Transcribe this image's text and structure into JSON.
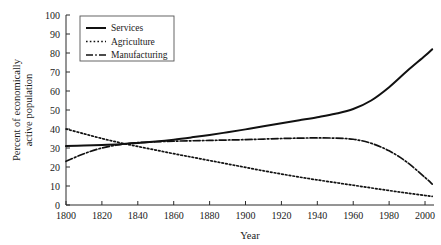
{
  "chart_data": {
    "type": "line",
    "title": "",
    "xlabel": "Year",
    "ylabel": "Percent of economically\nactive population",
    "ylabel_line1": "Percent of economically",
    "ylabel_line2": "active population",
    "xlim": [
      1800,
      2005
    ],
    "ylim": [
      0,
      100
    ],
    "xticks": [
      1800,
      1820,
      1840,
      1860,
      1880,
      1900,
      1920,
      1940,
      1960,
      1980,
      2000
    ],
    "xticklabels": [
      "1800",
      "1820",
      "1840",
      "1860",
      "1880",
      "1900",
      "1920",
      "1940",
      "1960",
      "1980",
      "2000"
    ],
    "yticks": [
      0,
      10,
      20,
      30,
      40,
      50,
      60,
      70,
      80,
      90,
      100
    ],
    "yticklabels": [
      "0",
      "10",
      "20",
      "30",
      "40",
      "50",
      "60",
      "70",
      "80",
      "90",
      "100"
    ],
    "grid": false,
    "legend_position": "upper-left",
    "series": [
      {
        "name": "Services",
        "style": "solid",
        "color": "#111111",
        "x": [
          1800,
          1810,
          1820,
          1830,
          1840,
          1850,
          1860,
          1870,
          1880,
          1890,
          1900,
          1910,
          1920,
          1930,
          1940,
          1950,
          1960,
          1970,
          1980,
          1990,
          2000,
          2004
        ],
        "values": [
          31,
          31.3,
          31.6,
          32,
          32.6,
          33.4,
          34.4,
          35.6,
          36.9,
          38.3,
          39.8,
          41.4,
          43.0,
          44.6,
          46.2,
          48.0,
          50.5,
          55.0,
          62.0,
          70.5,
          78.5,
          82
        ]
      },
      {
        "name": "Agriculture",
        "style": "dotted",
        "color": "#111111",
        "x": [
          1800,
          1810,
          1820,
          1830,
          1840,
          1850,
          1860,
          1870,
          1880,
          1890,
          1900,
          1910,
          1920,
          1930,
          1940,
          1950,
          1960,
          1970,
          1980,
          1990,
          2000,
          2004
        ],
        "values": [
          40,
          37.5,
          35,
          32.8,
          30.8,
          28.9,
          27.0,
          25.2,
          23.4,
          21.6,
          19.8,
          18.0,
          16.3,
          14.7,
          13.2,
          11.8,
          10.4,
          9.0,
          7.6,
          6.3,
          5.0,
          4.5
        ]
      },
      {
        "name": "Manufacturing",
        "style": "dashdot",
        "color": "#111111",
        "x": [
          1800,
          1810,
          1820,
          1830,
          1840,
          1850,
          1860,
          1870,
          1880,
          1890,
          1900,
          1910,
          1920,
          1930,
          1940,
          1950,
          1960,
          1970,
          1980,
          1990,
          2000,
          2004
        ],
        "values": [
          23,
          27,
          30,
          31.8,
          32.8,
          33.3,
          33.6,
          33.8,
          34.0,
          34.2,
          34.4,
          34.7,
          35.0,
          35.2,
          35.3,
          35.2,
          34.6,
          32.5,
          28.5,
          22.5,
          14.5,
          11
        ]
      }
    ],
    "legend": [
      {
        "label": "Services",
        "style": "solid"
      },
      {
        "label": "Agriculture",
        "style": "dotted"
      },
      {
        "label": "Manufacturing",
        "style": "dashdot"
      }
    ]
  }
}
